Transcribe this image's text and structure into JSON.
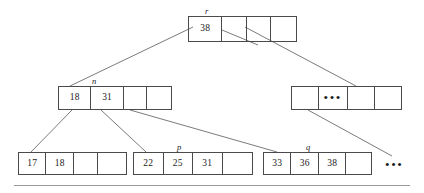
{
  "figure": {
    "type": "b-tree-diagram",
    "colors": {
      "node_border": "#4a4a4a",
      "edge": "#6b6b6b",
      "text": "#1a1a1a",
      "rule": "#9a9a9a",
      "background": "#ffffff"
    },
    "ellipsis_glyph": "•••",
    "tail_ellipsis": "•••"
  },
  "nodes": {
    "root": {
      "label": "r",
      "cells": [
        "38",
        "",
        "",
        ""
      ]
    },
    "internal_n": {
      "label": "n",
      "cells": [
        "18",
        "31",
        "",
        ""
      ]
    },
    "internal_right": {
      "label": "",
      "cells": [
        "",
        "•••",
        "",
        ""
      ]
    },
    "leaf_1": {
      "label": "",
      "cells": [
        "17",
        "18",
        "",
        ""
      ]
    },
    "leaf_p": {
      "label": "p",
      "cells": [
        "22",
        "25",
        "31",
        ""
      ]
    },
    "leaf_q": {
      "label": "q",
      "cells": [
        "33",
        "36",
        "38",
        ""
      ]
    }
  }
}
